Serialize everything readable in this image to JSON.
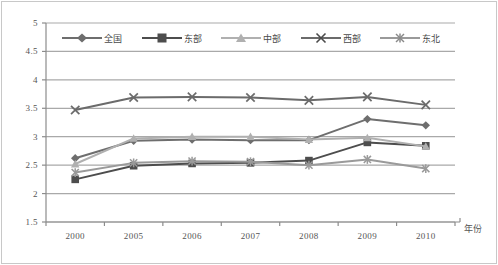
{
  "chart_data": {
    "type": "line",
    "title": "",
    "subtitle": "",
    "xlabel": "年份",
    "ylabel": "",
    "categories": [
      "2000",
      "2005",
      "2006",
      "2007",
      "2008",
      "2009",
      "2010"
    ],
    "ylim": [
      1.5,
      5
    ],
    "ytick_labels": [
      "5",
      "4.5",
      "4",
      "3.5",
      "3",
      "2.5",
      "2",
      "1.5"
    ],
    "ytick_values": [
      5,
      4.5,
      4,
      3.5,
      3,
      2.5,
      2,
      1.5
    ],
    "grid": true,
    "legend_position": "top-inside",
    "series": [
      {
        "name": "全国",
        "marker": "diamond",
        "color": "#6e6e6e",
        "values": [
          2.62,
          2.93,
          2.95,
          2.94,
          2.94,
          3.31,
          3.2
        ]
      },
      {
        "name": "东部",
        "marker": "square",
        "color": "#4d4d4d",
        "values": [
          2.25,
          2.49,
          2.53,
          2.54,
          2.58,
          2.9,
          2.84
        ]
      },
      {
        "name": "中部",
        "marker": "triangle",
        "color": "#b0b0b0",
        "values": [
          2.52,
          2.97,
          3.0,
          3.0,
          2.95,
          2.98,
          2.83
        ]
      },
      {
        "name": "西部",
        "marker": "x",
        "color": "#6b6b6b",
        "values": [
          3.47,
          3.69,
          3.7,
          3.69,
          3.64,
          3.7,
          3.56
        ]
      },
      {
        "name": "东北",
        "marker": "asterisk",
        "color": "#9a9a9a",
        "values": [
          2.37,
          2.54,
          2.57,
          2.56,
          2.5,
          2.6,
          2.44
        ]
      }
    ]
  },
  "colors": {
    "grid": "#a9a9a9",
    "axis": "#8c8c8c",
    "border": "#c8c8c8",
    "text": "#555555",
    "background": "#ffffff"
  }
}
